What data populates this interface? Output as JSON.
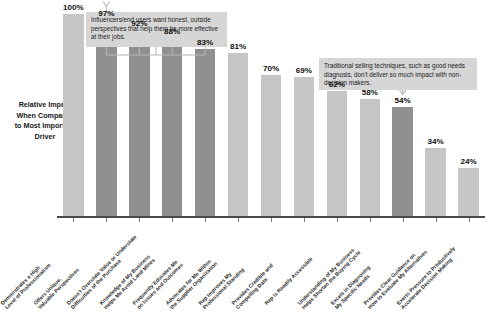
{
  "chart_data": {
    "type": "bar",
    "title": "",
    "xlabel": "",
    "ylabel": "Relative Impact When Compared to Most Important Driver",
    "ylim": [
      0,
      100
    ],
    "grid": false,
    "legend": "none",
    "value_suffix": "%",
    "categories": [
      "Demonstrates a High\nLevel of Professionalism",
      "Offers Unique,\nValuable Perspectives",
      "Doesn't Overstate Value or Understate\nDifficulties of the Purchase",
      "Knowledge of My Business\nHelps Me Avoid Land Mines",
      "Frequently Educates Me\non Issues and Outcomes",
      "Advocates for Me Within\nthe Supplier Organization",
      "Rep Improves My\nProfessional Standing",
      "Provides Credible and\nCompelling Data",
      "Rep is Readily Accessible",
      "Understanding of My Business\nHelps Shorten the Buying Cycle",
      "Excels in Diagnosing\nMy Specific Needs",
      "Provides Clear Guidance on\nHow to Evaluate My Alternatives",
      "Exerts Pressure to Productively\nAccelerate Decision Making"
    ],
    "values": [
      100,
      97,
      92,
      88,
      83,
      81,
      70,
      69,
      62,
      58,
      54,
      34,
      24
    ],
    "value_labels": [
      "100%",
      "97%",
      "92%",
      "88%",
      "83%",
      "81%",
      "70%",
      "69%",
      "62%",
      "58%",
      "54%",
      "34%",
      "24%"
    ],
    "bar_shades": [
      "light",
      "dark",
      "dark",
      "dark",
      "dark",
      "light",
      "light",
      "light",
      "light",
      "light",
      "dark",
      "light",
      "light"
    ],
    "colors": {
      "bar_light": "#c6c6c6",
      "bar_dark": "#909090",
      "callout_bg": "#d6d6d6",
      "axis": "#4a4a4a",
      "text": "#1a1a1a"
    },
    "annotations": [
      {
        "id": "callout-1",
        "text": "Influencers/end users want honest, outside perspectives that help them be more effective at their jobs.",
        "targets": [
          1,
          2,
          3,
          4
        ]
      },
      {
        "id": "callout-2",
        "text": "Traditional selling techniques, such as good needs diagnosis, don't deliver so much impact with non-decision makers.",
        "targets": [
          10
        ]
      }
    ]
  }
}
